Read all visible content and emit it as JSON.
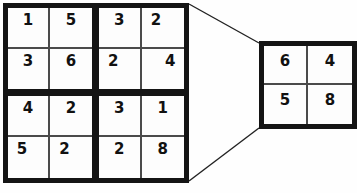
{
  "diagram": {
    "colors": {
      "thick_border": "#141414",
      "thin_border": "#4a4a4a",
      "cell_fill": "#fdfdfd",
      "background": "#ffffff",
      "digit": "#111111",
      "connector": "#222222"
    },
    "main_grid": {
      "name": "main-4x4-grid",
      "quadrants": [
        {
          "name": "top-left",
          "cells": [
            {
              "value": "1",
              "align": "center"
            },
            {
              "value": "5",
              "align": "center"
            },
            {
              "value": "3",
              "align": "center"
            },
            {
              "value": "6",
              "align": "center"
            }
          ]
        },
        {
          "name": "top-right",
          "cells": [
            {
              "value": "3",
              "align": "center"
            },
            {
              "value": "2",
              "align": "left"
            },
            {
              "value": "2",
              "align": "left"
            },
            {
              "value": "4",
              "align": "right"
            }
          ]
        },
        {
          "name": "bottom-left",
          "cells": [
            {
              "value": "4",
              "align": "center"
            },
            {
              "value": "2",
              "align": "center"
            },
            {
              "value": "5",
              "align": "left"
            },
            {
              "value": "2",
              "align": "left"
            }
          ]
        },
        {
          "name": "bottom-right",
          "cells": [
            {
              "value": "3",
              "align": "center"
            },
            {
              "value": "1",
              "align": "center"
            },
            {
              "value": "2",
              "align": "center"
            },
            {
              "value": "8",
              "align": "center"
            }
          ]
        }
      ]
    },
    "detail_grid": {
      "name": "detail-2x2-grid",
      "cells": [
        {
          "value": "6",
          "align": "center"
        },
        {
          "value": "4",
          "align": "center"
        },
        {
          "value": "5",
          "align": "center"
        },
        {
          "value": "8",
          "align": "center"
        }
      ]
    },
    "connectors": [
      {
        "name": "upper-callout-line",
        "x1": 189,
        "y1": 4,
        "x2": 259,
        "y2": 43
      },
      {
        "name": "lower-callout-line",
        "x1": 189,
        "y1": 181,
        "x2": 259,
        "y2": 128
      }
    ]
  }
}
